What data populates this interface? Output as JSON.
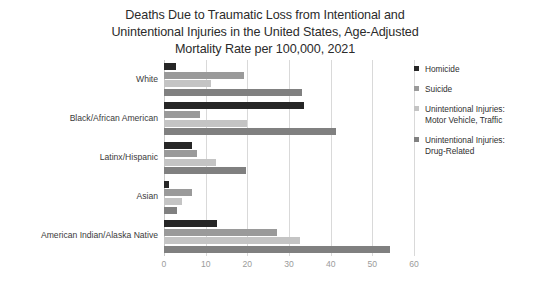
{
  "chart_data": {
    "type": "bar",
    "orientation": "horizontal",
    "title": "Deaths Due to Traumatic Loss from Intentional and\nUnintentional Injuries in the United States, Age-Adjusted\nMortality Rate per 100,000, 2021",
    "xlabel": "",
    "ylabel": "",
    "xlim": [
      0,
      60
    ],
    "xticks": [
      0,
      10,
      20,
      30,
      40,
      50,
      60
    ],
    "xtick_labels": [
      "0",
      "10",
      "20",
      "30",
      "40",
      "50",
      "60"
    ],
    "grid": "vertical",
    "legend_position": "right",
    "categories": [
      "White",
      "Black/African American",
      "Latinx/Hispanic",
      "Asian",
      "American Indian/Alaska Native"
    ],
    "series": [
      {
        "name": "Homicide",
        "color": "#262626",
        "values": [
          2.9,
          33.7,
          6.7,
          1.3,
          12.8
        ]
      },
      {
        "name": "Suicide",
        "color": "#9a9a9a",
        "values": [
          19.1,
          8.7,
          7.8,
          6.6,
          27.2
        ]
      },
      {
        "name": "Unintentional Injuries:\nMotor Vehicle, Traffic",
        "color": "#c4c4c4",
        "values": [
          11.2,
          20.0,
          12.4,
          4.3,
          32.6
        ]
      },
      {
        "name": "Unintentional Injuries:\nDrug-Related",
        "color": "#808080",
        "values": [
          33.1,
          41.3,
          19.6,
          3.0,
          54.3
        ]
      }
    ]
  },
  "colors": {
    "background": "#ffffff",
    "gridline": "#d9d9d9",
    "title_text": "#2b2b2b",
    "category_text": "#3a3a3a",
    "tick_text": "#9b9b9b",
    "legend_text": "#2f2f2f"
  }
}
